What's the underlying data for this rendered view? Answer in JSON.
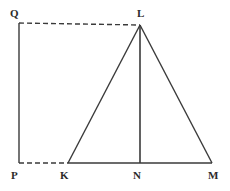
{
  "figure": {
    "width": 230,
    "height": 191,
    "background_color": "#ffffff",
    "stroke_color": "#3a3a3a",
    "label_color": "#2b2b2b",
    "points": {
      "Q": {
        "label": "Q",
        "x": 19,
        "y": 23,
        "label_x": 10,
        "label_y": 8
      },
      "L": {
        "label": "L",
        "x": 140,
        "y": 25,
        "label_x": 137,
        "label_y": 8
      },
      "P": {
        "label": "P",
        "x": 19,
        "y": 163,
        "label_x": 11,
        "label_y": 170
      },
      "K": {
        "label": "K",
        "x": 68,
        "y": 163,
        "label_x": 60,
        "label_y": 170
      },
      "N": {
        "label": "N",
        "x": 140,
        "y": 163,
        "label_x": 133,
        "label_y": 170
      },
      "M": {
        "label": "M",
        "x": 212,
        "y": 163,
        "label_x": 208,
        "label_y": 170
      }
    },
    "segments": [
      {
        "name": "segment-QL",
        "from": "Q",
        "to": "L",
        "style": "dashed",
        "width": 1.4
      },
      {
        "name": "segment-PK",
        "from": "P",
        "to": "K",
        "style": "dashed",
        "width": 1.4
      },
      {
        "name": "segment-PQ",
        "from": "P",
        "to": "Q",
        "style": "solid",
        "width": 1.4
      },
      {
        "name": "segment-KM",
        "from": "K",
        "to": "M",
        "style": "solid",
        "width": 1.4
      },
      {
        "name": "segment-KL",
        "from": "K",
        "to": "L",
        "style": "solid",
        "width": 1.4
      },
      {
        "name": "segment-LM",
        "from": "L",
        "to": "M",
        "style": "solid",
        "width": 1.4
      },
      {
        "name": "segment-LN",
        "from": "L",
        "to": "N",
        "style": "solid",
        "width": 1.6
      }
    ],
    "dash_pattern": "5,3"
  }
}
